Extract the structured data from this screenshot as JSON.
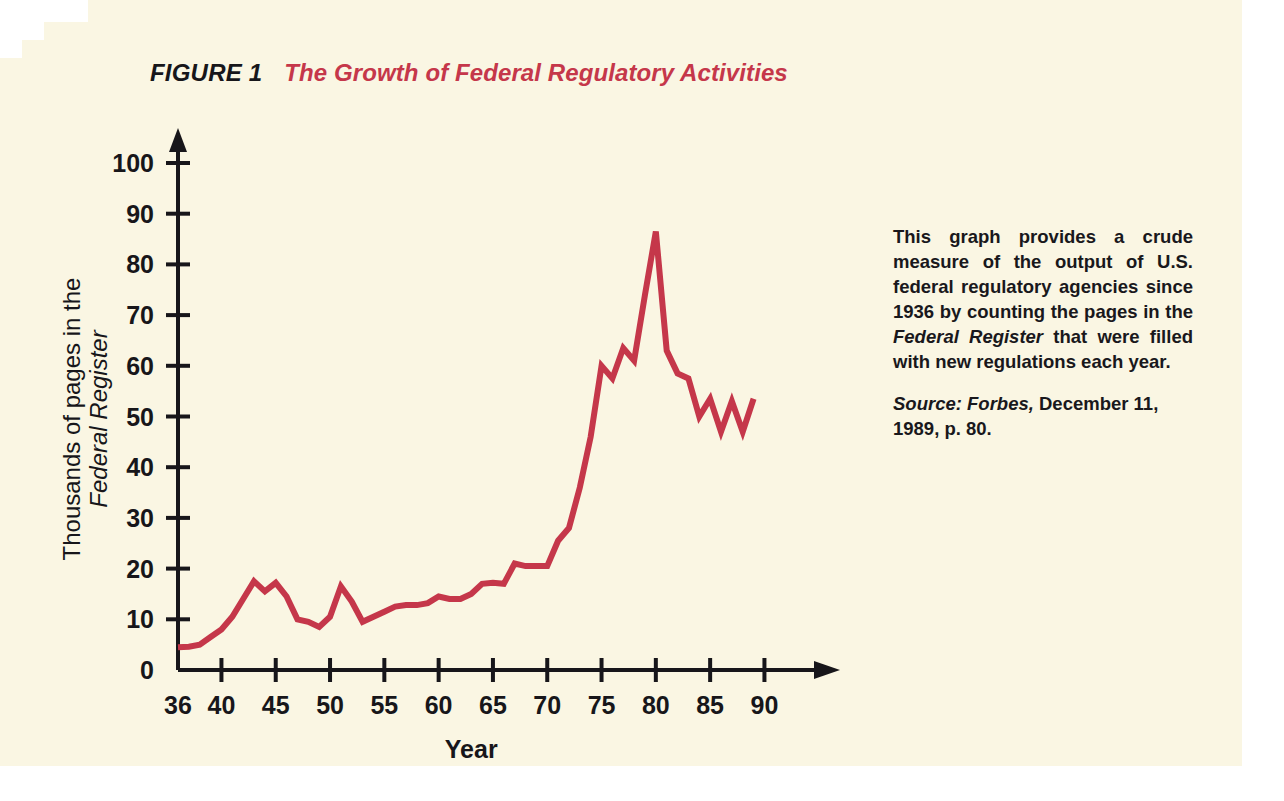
{
  "figure": {
    "number": "FIGURE 1",
    "title": "The Growth of Federal Regulatory Activities"
  },
  "caption": {
    "text_part1": "This graph provides a crude measure of the output of U.S. federal regulatory agencies since 1936 by counting the pages in the ",
    "text_italic": "Federal Register",
    "text_part2": " that were filled with new regulations each year.",
    "source_label": "Source:",
    "source_publication": "Forbes,",
    "source_rest": "December 11, 1989, p. 80."
  },
  "colors": {
    "page_background": "#faf6e3",
    "line": "#c5374a",
    "title_accent": "#c5374a",
    "axis": "#17161a",
    "text": "#19181c"
  },
  "chart_data": {
    "type": "line",
    "title": "The Growth of Federal Regulatory Activities",
    "xlabel": "Year",
    "ylabel": "Thousands of pages in the Federal Register",
    "ylabel_line1": "Thousands of pages in the",
    "ylabel_line2": "Federal Register",
    "xlim": [
      36,
      90
    ],
    "ylim": [
      0,
      100
    ],
    "xticks": [
      36,
      40,
      45,
      50,
      55,
      60,
      65,
      70,
      75,
      80,
      85,
      90
    ],
    "xtick_labels": [
      "36",
      "40",
      "45",
      "50",
      "55",
      "60",
      "65",
      "70",
      "75",
      "80",
      "85",
      "90"
    ],
    "yticks": [
      0,
      10,
      20,
      30,
      40,
      50,
      60,
      70,
      80,
      90,
      100
    ],
    "ytick_labels": [
      "0",
      "10",
      "20",
      "30",
      "40",
      "50",
      "60",
      "70",
      "80",
      "90",
      "100"
    ],
    "grid": false,
    "legend": false,
    "series": [
      {
        "name": "Pages in the Federal Register",
        "x": [
          36,
          37,
          38,
          39,
          40,
          41,
          42,
          43,
          44,
          45,
          46,
          47,
          48,
          49,
          50,
          51,
          52,
          53,
          54,
          55,
          56,
          57,
          58,
          59,
          60,
          61,
          62,
          63,
          64,
          65,
          66,
          67,
          68,
          69,
          70,
          71,
          72,
          73,
          74,
          75,
          76,
          77,
          78,
          79,
          80,
          81,
          82,
          83,
          84,
          85,
          86,
          87,
          88,
          89
        ],
        "values": [
          4.5,
          4.6,
          5.0,
          6.5,
          8.0,
          10.5,
          14.0,
          17.5,
          15.5,
          17.2,
          14.5,
          10.0,
          9.5,
          8.5,
          10.5,
          16.5,
          13.5,
          9.5,
          10.5,
          11.5,
          12.5,
          12.8,
          12.8,
          13.2,
          14.5,
          14.0,
          14.0,
          15.0,
          17.0,
          17.2,
          17.0,
          21.0,
          20.5,
          20.5,
          20.5,
          25.5,
          28.0,
          36.0,
          46.0,
          60.0,
          57.5,
          63.5,
          61.0,
          74.0,
          86.5,
          63.0,
          58.5,
          57.5,
          50.0,
          53.5,
          47.0,
          53.0,
          47.0,
          53.5
        ]
      }
    ]
  }
}
